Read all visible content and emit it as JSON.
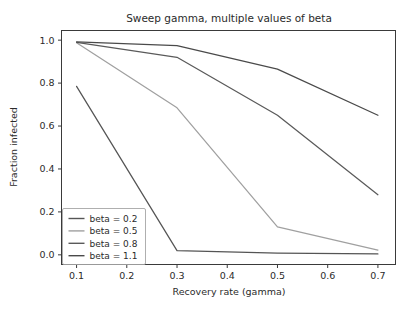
{
  "chart_data": {
    "type": "line",
    "title": "Sweep gamma, multiple values of beta",
    "xlabel": "Recovery rate (gamma)",
    "ylabel": "Fraction infected",
    "xlim": [
      0.07,
      0.735
    ],
    "ylim": [
      -0.045,
      1.045
    ],
    "xticks": [
      0.1,
      0.2,
      0.3,
      0.4,
      0.5,
      0.6,
      0.7
    ],
    "xticklabels": [
      "0.1",
      "0.2",
      "0.3",
      "0.4",
      "0.5",
      "0.6",
      "0.7"
    ],
    "yticks": [
      0.0,
      0.2,
      0.4,
      0.6,
      0.8,
      1.0
    ],
    "yticklabels": [
      "0.0",
      "0.2",
      "0.4",
      "0.6",
      "0.8",
      "1.0"
    ],
    "grid": false,
    "legend_position": "lower left",
    "x": [
      0.1,
      0.3,
      0.5,
      0.7
    ],
    "series": [
      {
        "name": "beta = 0.2",
        "label": "beta = 0.2",
        "color": "#555555",
        "values": [
          0.785,
          0.02,
          0.008,
          0.004
        ]
      },
      {
        "name": "beta = 0.5",
        "label": "beta = 0.5",
        "color": "#a0a0a0",
        "values": [
          0.988,
          0.685,
          0.13,
          0.022
        ]
      },
      {
        "name": "beta = 0.8",
        "label": "beta = 0.8",
        "color": "#5a5a5a",
        "values": [
          0.99,
          0.92,
          0.65,
          0.28
        ]
      },
      {
        "name": "beta = 1.1",
        "label": "beta = 1.1",
        "color": "#4a4a4a",
        "values": [
          0.992,
          0.975,
          0.865,
          0.65
        ]
      }
    ]
  },
  "colors": {
    "background": "#ffffff",
    "axis": "#3a3a3a",
    "text": "#2b2b2b",
    "legend_border": "#9b9b9b"
  }
}
